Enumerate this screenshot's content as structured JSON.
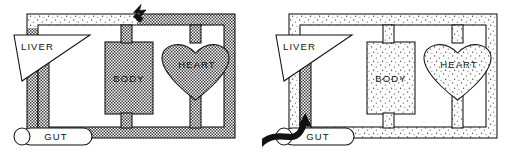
{
  "figure": {
    "panel_count": 2,
    "ink_color": "#111111",
    "background_color": "#ffffff"
  },
  "panels": [
    {
      "id": "left",
      "name": "oral-dose-panel",
      "arrow": {
        "name": "dose-arrow-top",
        "direction": "left-up",
        "style": "bent-solid-arrow",
        "position": "top-center",
        "label": ""
      },
      "organs": {
        "liver": {
          "label": "LIVER",
          "shape": "triangle",
          "fill": "white"
        },
        "body": {
          "label": "BODY",
          "shape": "rectangle",
          "fill": "dark-stipple"
        },
        "heart": {
          "label": "HEART",
          "shape": "heart",
          "fill": "dark-stipple"
        },
        "gut": {
          "label": "GUT",
          "shape": "capsule",
          "fill": "white"
        }
      },
      "vessels": {
        "outer_loop_fill": "dark-stipple",
        "top_left_segment_fill": "light-stipple",
        "portal_vein_fill": "dark-stipple"
      }
    },
    {
      "id": "right",
      "name": "portal-dose-panel",
      "arrow": {
        "name": "dose-arrow-gut",
        "direction": "up-right",
        "style": "curved-solid-arrow",
        "position": "bottom-left",
        "label": ""
      },
      "organs": {
        "liver": {
          "label": "LIVER",
          "shape": "triangle",
          "fill": "white"
        },
        "body": {
          "label": "BODY",
          "shape": "rectangle",
          "fill": "light-stipple"
        },
        "heart": {
          "label": "HEART",
          "shape": "heart",
          "fill": "light-stipple"
        },
        "gut": {
          "label": "GUT",
          "shape": "capsule",
          "fill": "white"
        }
      },
      "vessels": {
        "outer_loop_fill": "light-stipple",
        "top_left_segment_fill": "light-stipple",
        "portal_vein_fill": "dark-stipple"
      }
    }
  ],
  "legend": {
    "dark_stipple_meaning": "high drug concentration",
    "light_stipple_meaning": "low drug concentration"
  }
}
